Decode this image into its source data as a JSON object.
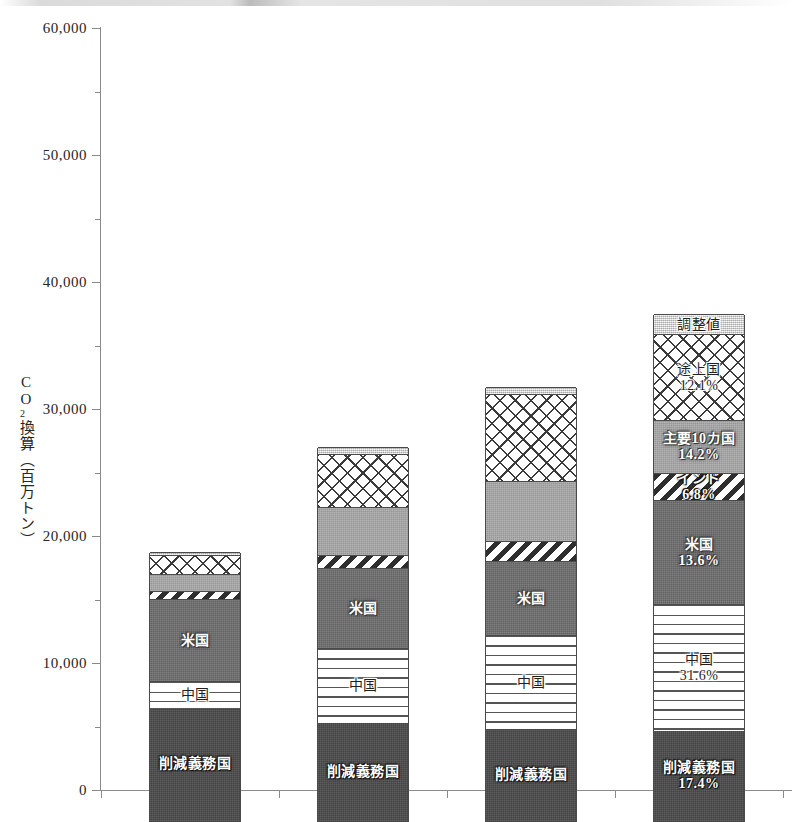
{
  "chart_data": {
    "type": "bar",
    "subtype": "stacked-bar",
    "title": "",
    "xlabel": "",
    "ylabel": "CO2換算（百万トン）",
    "ylabel_parts": [
      "C",
      "O",
      "2",
      "換",
      "算",
      "（",
      "百",
      "万",
      "ト",
      "ン",
      "）"
    ],
    "categories": [
      "1990",
      "2009",
      "2020",
      "2030"
    ],
    "ylim": [
      0,
      60000
    ],
    "ytick_values": [
      0,
      10000,
      20000,
      30000,
      40000,
      50000,
      60000
    ],
    "ytick_labels": [
      "0",
      "10,000",
      "20,000",
      "30,000",
      "40,000",
      "50,000",
      "60,000"
    ],
    "yminor_step": 5000,
    "grid": false,
    "legend": "in-bar-labels",
    "stack_order_bottom_to_top": [
      "削減義務国",
      "中国",
      "米国",
      "インド",
      "主要10カ国",
      "途上国",
      "調整値"
    ],
    "series": [
      {
        "name": "削減義務国",
        "pattern": "solid-dark",
        "color": "#4b4b4b",
        "values": [
          8900,
          7720,
          7240,
          7090
        ],
        "labels": [
          "削減義務国",
          "削減義務国",
          "削減義務国",
          "削減義務国"
        ],
        "percent_labels": [
          "",
          "",
          "",
          "17.4%"
        ]
      },
      {
        "name": "中国",
        "pattern": "horizontal-lines",
        "color": "#ffffff",
        "values": [
          2120,
          5900,
          7410,
          9990
        ],
        "labels": [
          "中国",
          "中国",
          "中国",
          "中国"
        ],
        "percent_labels": [
          "",
          "",
          "",
          "31.6%"
        ]
      },
      {
        "name": "米国",
        "pattern": "solid-mid-gray",
        "color": "#6f6f6f",
        "values": [
          6460,
          6300,
          5820,
          8190
        ],
        "labels": [
          "米国",
          "米国",
          "米国",
          "米国"
        ],
        "percent_labels": [
          "",
          "",
          "",
          "13.6%"
        ]
      },
      {
        "name": "インド",
        "pattern": "diagonal-stripes",
        "color": "#ffffff",
        "values": [
          630,
          1030,
          1580,
          2120
        ],
        "labels": [
          "",
          "",
          "",
          "インド"
        ],
        "percent_labels": [
          "",
          "",
          "",
          "6.8%"
        ]
      },
      {
        "name": "主要10カ国",
        "pattern": "solid-light-gray",
        "color": "#a8a8a8",
        "values": [
          1340,
          3770,
          4720,
          4170
        ],
        "labels": [
          "",
          "",
          "",
          "主要10カ国"
        ],
        "percent_labels": [
          "",
          "",
          "",
          "14.2%"
        ]
      },
      {
        "name": "途上国",
        "pattern": "crosshatch",
        "color": "#ffffff",
        "values": [
          1500,
          4180,
          6850,
          6780
        ],
        "labels": [
          "",
          "",
          "",
          "途上国"
        ],
        "percent_labels": [
          "",
          "",
          "",
          "12.1%"
        ]
      },
      {
        "name": "調整値",
        "pattern": "light-stipple",
        "color": "#e2e2e2",
        "values": [
          230,
          550,
          550,
          1570
        ],
        "labels": [
          "",
          "",
          "",
          "調整値"
        ],
        "percent_labels": [
          "",
          "",
          "",
          ""
        ]
      }
    ],
    "totals": [
      21180,
      29450,
      34170,
      39920
    ]
  },
  "axis": {
    "y_title": "CO2換算（百万トン）"
  }
}
